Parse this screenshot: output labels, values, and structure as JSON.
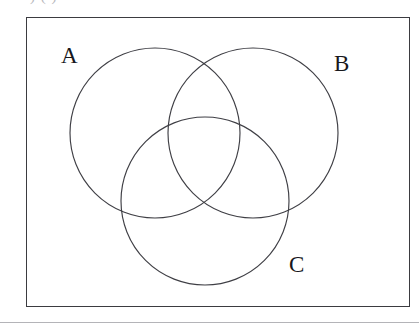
{
  "page": {
    "width": 419,
    "height": 330,
    "background_color": "#ffffff",
    "clipped_header_text": ")      (        )"
  },
  "frame": {
    "name": "figure-border",
    "x": 26,
    "y": 17,
    "width": 384,
    "height": 290,
    "stroke_color": "#3b3b40"
  },
  "footer_rule": {
    "y": 322,
    "color": "#b4b4b8"
  },
  "diagram": {
    "type": "venn",
    "set_count": 3,
    "stroke_color": "#3f3f45",
    "fill_color": "none",
    "labels": {
      "a": "A",
      "b": "B",
      "c": "C"
    },
    "circles": [
      {
        "id": "A",
        "label": "A",
        "cx": 155,
        "cy": 133,
        "r": 85
      },
      {
        "id": "B",
        "label": "B",
        "cx": 253,
        "cy": 133,
        "r": 85
      },
      {
        "id": "C",
        "label": "C",
        "cx": 205,
        "cy": 201,
        "r": 84
      }
    ],
    "label_positions": [
      {
        "id": "A",
        "x": 70,
        "y": 56
      },
      {
        "id": "B",
        "x": 343,
        "y": 64
      },
      {
        "id": "C",
        "x": 298,
        "y": 265
      }
    ]
  }
}
